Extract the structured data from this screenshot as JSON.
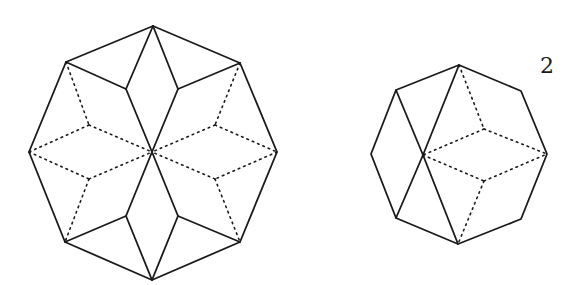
{
  "figure": {
    "label": "2",
    "stroke_color": "#1a1a1a",
    "background": "#ffffff"
  },
  "large_octagon": {
    "outline": [
      [
        153,
        26
      ],
      [
        240,
        63
      ],
      [
        277,
        152
      ],
      [
        240,
        242
      ],
      [
        152,
        280
      ],
      [
        65,
        242
      ],
      [
        29,
        152
      ],
      [
        66,
        62
      ]
    ],
    "center": [
      152,
      152
    ],
    "solid_segments": [
      [
        [
          153,
          26
        ],
        [
          126,
          89
        ]
      ],
      [
        [
          126,
          89
        ],
        [
          66,
          62
        ]
      ],
      [
        [
          126,
          89
        ],
        [
          152,
          152
        ]
      ],
      [
        [
          153,
          26
        ],
        [
          178,
          89
        ]
      ],
      [
        [
          178,
          89
        ],
        [
          240,
          63
        ]
      ],
      [
        [
          178,
          89
        ],
        [
          152,
          152
        ]
      ],
      [
        [
          152,
          280
        ],
        [
          126,
          216
        ]
      ],
      [
        [
          126,
          216
        ],
        [
          65,
          242
        ]
      ],
      [
        [
          126,
          216
        ],
        [
          152,
          152
        ]
      ],
      [
        [
          152,
          280
        ],
        [
          178,
          216
        ]
      ],
      [
        [
          178,
          216
        ],
        [
          240,
          242
        ]
      ],
      [
        [
          178,
          216
        ],
        [
          152,
          152
        ]
      ]
    ],
    "dotted_segments": [
      [
        [
          66,
          62
        ],
        [
          89,
          125
        ]
      ],
      [
        [
          89,
          125
        ],
        [
          29,
          152
        ]
      ],
      [
        [
          89,
          125
        ],
        [
          152,
          152
        ]
      ],
      [
        [
          29,
          152
        ],
        [
          89,
          179
        ]
      ],
      [
        [
          89,
          179
        ],
        [
          152,
          152
        ]
      ],
      [
        [
          89,
          179
        ],
        [
          65,
          242
        ]
      ],
      [
        [
          240,
          63
        ],
        [
          215,
          125
        ]
      ],
      [
        [
          215,
          125
        ],
        [
          277,
          152
        ]
      ],
      [
        [
          215,
          125
        ],
        [
          152,
          152
        ]
      ],
      [
        [
          277,
          152
        ],
        [
          215,
          179
        ]
      ],
      [
        [
          215,
          179
        ],
        [
          152,
          152
        ]
      ],
      [
        [
          215,
          179
        ],
        [
          240,
          242
        ]
      ]
    ]
  },
  "small_octagon": {
    "outline": [
      [
        459,
        65
      ],
      [
        521,
        91
      ],
      [
        547,
        154
      ],
      [
        521,
        219
      ],
      [
        458,
        244
      ],
      [
        396,
        218
      ],
      [
        371,
        154
      ],
      [
        396,
        90
      ]
    ],
    "crossing_point": [
      423,
      155
    ],
    "solid_segments": [
      [
        [
          396,
          90
        ],
        [
          423,
          155
        ]
      ],
      [
        [
          423,
          155
        ],
        [
          458,
          244
        ]
      ],
      [
        [
          459,
          65
        ],
        [
          423,
          155
        ]
      ],
      [
        [
          423,
          155
        ],
        [
          396,
          218
        ]
      ]
    ],
    "dotted_segments": [
      [
        [
          459,
          65
        ],
        [
          484,
          129
        ]
      ],
      [
        [
          484,
          129
        ],
        [
          547,
          154
        ]
      ],
      [
        [
          484,
          129
        ],
        [
          423,
          155
        ]
      ],
      [
        [
          423,
          155
        ],
        [
          484,
          181
        ]
      ],
      [
        [
          484,
          181
        ],
        [
          547,
          154
        ]
      ],
      [
        [
          484,
          181
        ],
        [
          458,
          244
        ]
      ]
    ]
  },
  "label_position": [
    547,
    73
  ]
}
